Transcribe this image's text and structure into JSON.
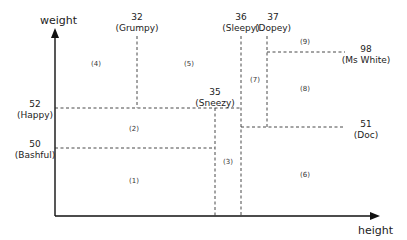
{
  "axes": {
    "y_label": "weight",
    "x_label": "height"
  },
  "splits": [
    {
      "value": "32",
      "name": "(Grumpy)",
      "orientation": "vertical"
    },
    {
      "value": "36",
      "name": "(Sleepy)",
      "orientation": "vertical"
    },
    {
      "value": "37",
      "name": "(Dopey)",
      "orientation": "vertical"
    },
    {
      "value": "98",
      "name": "(Ms White)",
      "orientation": "horizontal"
    },
    {
      "value": "35",
      "name": "(Sneezy)",
      "orientation": "vertical"
    },
    {
      "value": "52",
      "name": "(Happy)",
      "orientation": "horizontal"
    },
    {
      "value": "51",
      "name": "(Doc)",
      "orientation": "horizontal"
    },
    {
      "value": "50",
      "name": "(Bashful)",
      "orientation": "horizontal"
    }
  ],
  "regions": [
    "(1)",
    "(2)",
    "(3)",
    "(4)",
    "(5)",
    "(6)",
    "(7)",
    "(8)",
    "(9)"
  ]
}
